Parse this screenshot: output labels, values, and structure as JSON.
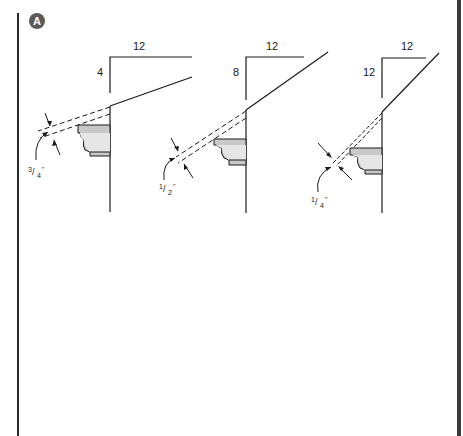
{
  "figure": {
    "badge": "A",
    "colors": {
      "line": "#1a1a1a",
      "molding_fill": "#c8c8c8",
      "molding_face": "#e6e6e6",
      "badge_bg": "#5a5a5a",
      "border": "#3a3a3a"
    },
    "panels": [
      {
        "id": "pitch-4-12",
        "run_label": "12",
        "rise_label": "4",
        "gap_label": {
          "num": "3",
          "den": "4",
          "unit": "\""
        }
      },
      {
        "id": "pitch-8-12",
        "run_label": "12",
        "rise_label": "8",
        "gap_label": {
          "num": "1",
          "den": "2",
          "unit": "\""
        }
      },
      {
        "id": "pitch-12-12",
        "run_label": "12",
        "rise_label": "12",
        "gap_label": {
          "num": "1",
          "den": "4",
          "unit": "\""
        }
      }
    ]
  }
}
